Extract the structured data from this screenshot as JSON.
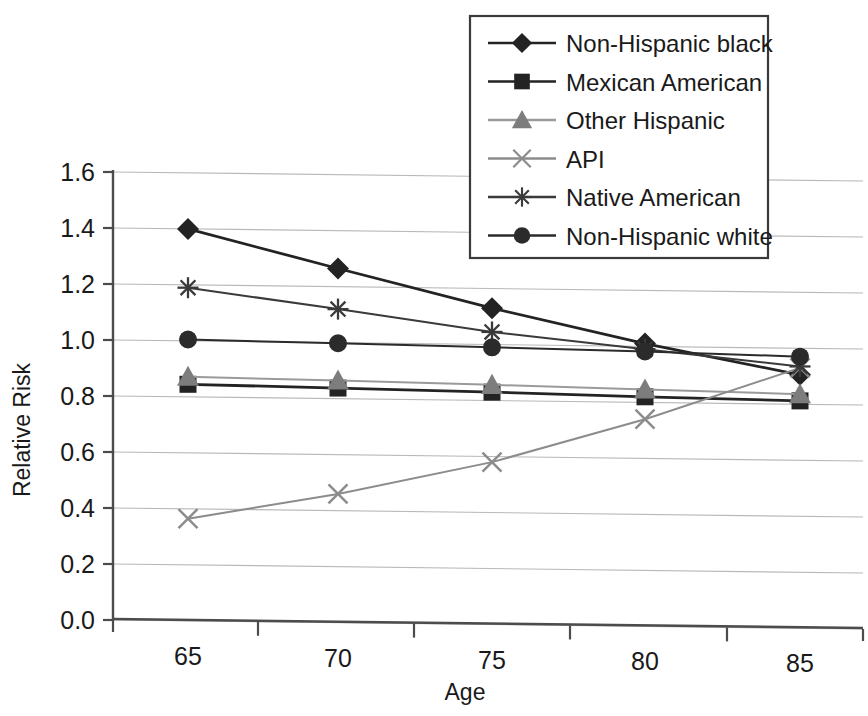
{
  "chart_data": {
    "type": "line",
    "title": "",
    "xlabel": "Age",
    "ylabel": "Relative Risk",
    "categories": [
      "65",
      "70",
      "75",
      "80",
      "85"
    ],
    "x": [
      65,
      70,
      75,
      80,
      85
    ],
    "ylim": [
      0.0,
      1.6
    ],
    "yticks": [
      "0.0",
      "0.2",
      "0.4",
      "0.6",
      "0.8",
      "1.0",
      "1.2",
      "1.4",
      "1.6"
    ],
    "ytick_values": [
      0.0,
      0.2,
      0.4,
      0.6,
      0.8,
      1.0,
      1.2,
      1.4,
      1.6
    ],
    "grid": "horizontal",
    "legend_position": "top-right-overlay",
    "series": [
      {
        "name": "Non-Hispanic black",
        "marker": "diamond",
        "color": "#232323",
        "line_color": "#232323",
        "values": [
          1.4,
          1.265,
          1.13,
          1.01,
          0.905
        ]
      },
      {
        "name": "Mexican American",
        "marker": "square",
        "color": "#232323",
        "line_color": "#232323",
        "values": [
          0.845,
          0.838,
          0.83,
          0.82,
          0.812
        ]
      },
      {
        "name": "Other Hispanic",
        "marker": "triangle",
        "color": "#7d7d7d",
        "line_color": "#9a9a9a",
        "values": [
          0.872,
          0.865,
          0.856,
          0.846,
          0.836
        ]
      },
      {
        "name": "API",
        "marker": "x",
        "color": "#8c8c8c",
        "line_color": "#8c8c8c",
        "values": [
          0.365,
          0.46,
          0.58,
          0.74,
          0.93
        ]
      },
      {
        "name": "Native American",
        "marker": "asterisk",
        "color": "#3a3a3a",
        "line_color": "#3a3a3a",
        "values": [
          1.19,
          1.12,
          1.045,
          0.99,
          0.935
        ]
      },
      {
        "name": "Non-Hispanic white",
        "marker": "circle",
        "color": "#2b2b2b",
        "line_color": "#2b2b2b",
        "values": [
          1.005,
          0.998,
          0.99,
          0.982,
          0.97
        ]
      }
    ]
  },
  "legend": {
    "entries": [
      {
        "label": "Non-Hispanic black"
      },
      {
        "label": "Mexican American"
      },
      {
        "label": "Other Hispanic"
      },
      {
        "label": "API"
      },
      {
        "label": "Native American"
      },
      {
        "label": "Non-Hispanic white"
      }
    ]
  },
  "axes": {
    "x_title": "Age",
    "y_title": "Relative Risk",
    "x_tick_labels": [
      "65",
      "70",
      "75",
      "80",
      "85"
    ],
    "y_tick_labels": [
      "1.6",
      "1.4",
      "1.2",
      "1.0",
      "0.8",
      "0.6",
      "0.4",
      "0.2",
      "0.0"
    ]
  },
  "colors": {
    "grid": "#b9b9b9",
    "axis": "#4c4c4c",
    "legend_border": "#3a3a3a",
    "background": "#ffffff",
    "text": "#1a1a1a"
  }
}
